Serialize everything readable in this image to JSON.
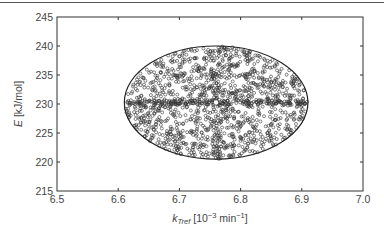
{
  "chart_data": {
    "type": "scatter",
    "title": "",
    "xlabel": "k_Tref [10^-3 min^-1]",
    "xlabel_parts": {
      "main": "k",
      "sub": "Tref",
      "rest_pre": " [10",
      "sup1": "−3",
      "rest_mid": " min",
      "sup2": "−1",
      "rest_post": "]"
    },
    "ylabel": "E [kJ/mol]",
    "ylabel_parts": {
      "italic": "E",
      "rest": " [kJ/mol]"
    },
    "xlim": [
      6.5,
      7.0
    ],
    "ylim": [
      215,
      245
    ],
    "x_ticks": [
      "6.5",
      "6.6",
      "6.7",
      "6.8",
      "6.9",
      "7.0"
    ],
    "y_ticks": [
      "215",
      "220",
      "225",
      "230",
      "235",
      "240",
      "245"
    ],
    "grid": false,
    "legend": null,
    "annotations": [],
    "series": [
      {
        "name": "samples",
        "marker": "open-circle",
        "color": "#333333",
        "distribution": "uniform within ellipse, denser along horizontal centre line",
        "approx_points": 1500,
        "ellipse": {
          "center_x": 6.76,
          "center_y": 230.2,
          "x_min": 6.61,
          "x_max": 6.91,
          "y_min": 220.5,
          "y_max": 240.0
        }
      }
    ]
  }
}
